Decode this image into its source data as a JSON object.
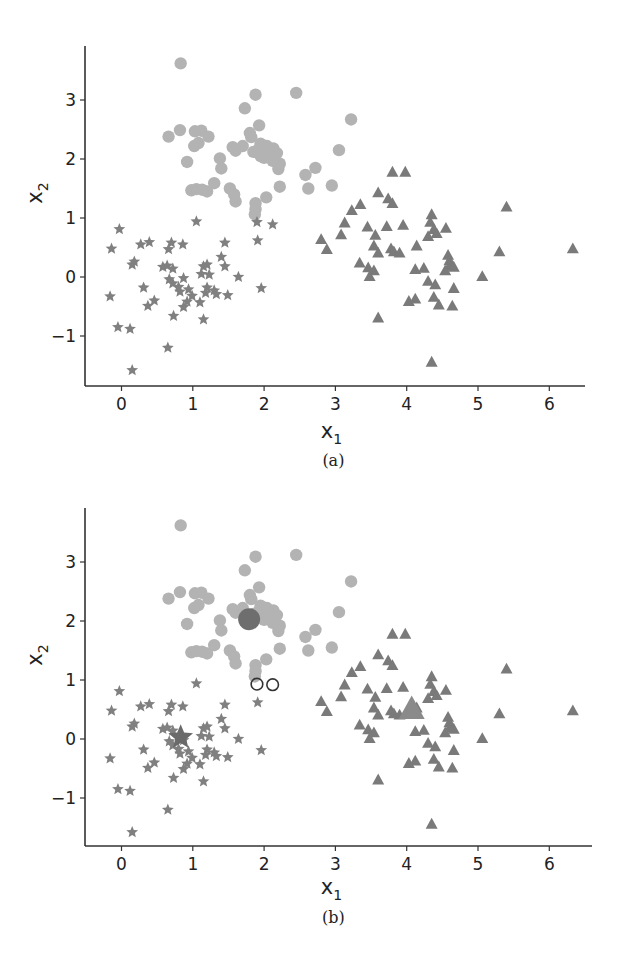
{
  "figure": {
    "panels": [
      {
        "id": "a",
        "caption": "(a)"
      },
      {
        "id": "b",
        "caption": "(b)"
      }
    ]
  },
  "chart_data": [
    {
      "type": "scatter",
      "title": "",
      "caption": "(a)",
      "xlabel": "x1",
      "ylabel": "x2",
      "xlim": [
        -0.5,
        6.6
      ],
      "ylim": [
        -1.85,
        3.9
      ],
      "xticks": [
        0,
        1,
        2,
        3,
        4,
        5,
        6
      ],
      "yticks": [
        -1,
        0,
        1,
        2,
        3
      ],
      "grid": false,
      "legend": null,
      "series": [
        {
          "name": "cluster-circles",
          "marker": "circle",
          "color": "#b3b3b3",
          "points": [
            [
              0.83,
              3.62
            ],
            [
              0.66,
              2.38
            ],
            [
              0.82,
              2.49
            ],
            [
              1.03,
              2.47
            ],
            [
              1.12,
              2.48
            ],
            [
              1.22,
              2.38
            ],
            [
              1.02,
              2.22
            ],
            [
              1.08,
              2.27
            ],
            [
              0.92,
              1.95
            ],
            [
              1.38,
              2.01
            ],
            [
              1.4,
              1.84
            ],
            [
              1.56,
              2.2
            ],
            [
              1.6,
              2.14
            ],
            [
              1.7,
              2.22
            ],
            [
              1.8,
              2.44
            ],
            [
              1.82,
              2.37
            ],
            [
              1.73,
              2.86
            ],
            [
              1.88,
              3.09
            ],
            [
              1.93,
              2.57
            ],
            [
              1.95,
              2.26
            ],
            [
              1.85,
              2.12
            ],
            [
              1.95,
              2.05
            ],
            [
              2.0,
              2.02
            ],
            [
              2.06,
              2.12
            ],
            [
              2.13,
              2.18
            ],
            [
              2.18,
              2.1
            ],
            [
              2.22,
              1.92
            ],
            [
              2.2,
              1.83
            ],
            [
              1.92,
              2.16
            ],
            [
              2.04,
              2.22
            ],
            [
              2.12,
              1.97
            ],
            [
              0.98,
              1.47
            ],
            [
              1.05,
              1.49
            ],
            [
              1.13,
              1.48
            ],
            [
              1.2,
              1.45
            ],
            [
              1.3,
              1.59
            ],
            [
              1.52,
              1.5
            ],
            [
              1.58,
              1.4
            ],
            [
              1.6,
              1.28
            ],
            [
              1.88,
              1.25
            ],
            [
              1.88,
              1.15
            ],
            [
              1.87,
              1.06
            ],
            [
              2.03,
              1.35
            ],
            [
              2.22,
              1.53
            ],
            [
              2.45,
              3.12
            ],
            [
              2.58,
              1.73
            ],
            [
              2.62,
              1.5
            ],
            [
              2.72,
              1.85
            ],
            [
              2.95,
              1.55
            ],
            [
              3.05,
              2.15
            ],
            [
              3.22,
              2.67
            ]
          ]
        },
        {
          "name": "cluster-stars",
          "marker": "star",
          "color": "#808080",
          "points": [
            [
              -0.03,
              0.81
            ],
            [
              -0.14,
              0.48
            ],
            [
              0.15,
              0.21
            ],
            [
              0.18,
              0.26
            ],
            [
              0.27,
              0.55
            ],
            [
              0.39,
              0.59
            ],
            [
              0.66,
              0.47
            ],
            [
              0.7,
              0.58
            ],
            [
              0.86,
              0.55
            ],
            [
              1.05,
              0.94
            ],
            [
              1.45,
              0.58
            ],
            [
              1.9,
              0.93
            ],
            [
              1.91,
              0.62
            ],
            [
              2.12,
              0.89
            ],
            [
              -0.16,
              -0.33
            ],
            [
              0.31,
              -0.18
            ],
            [
              0.37,
              -0.49
            ],
            [
              0.46,
              -0.4
            ],
            [
              0.58,
              0.17
            ],
            [
              0.64,
              0.19
            ],
            [
              0.72,
              0.14
            ],
            [
              0.67,
              -0.04
            ],
            [
              0.72,
              -0.11
            ],
            [
              0.8,
              -0.17
            ],
            [
              0.82,
              -0.25
            ],
            [
              0.87,
              -0.02
            ],
            [
              0.94,
              -0.21
            ],
            [
              0.99,
              -0.32
            ],
            [
              0.92,
              -0.42
            ],
            [
              0.87,
              -0.51
            ],
            [
              1.1,
              -0.43
            ],
            [
              1.12,
              0.05
            ],
            [
              1.15,
              0.18
            ],
            [
              1.2,
              0.21
            ],
            [
              1.23,
              0.04
            ],
            [
              1.2,
              -0.18
            ],
            [
              1.18,
              -0.27
            ],
            [
              1.3,
              -0.23
            ],
            [
              1.33,
              -0.29
            ],
            [
              1.4,
              0.34
            ],
            [
              1.45,
              0.18
            ],
            [
              1.49,
              -0.31
            ],
            [
              1.64,
              0.0
            ],
            [
              1.96,
              -0.19
            ],
            [
              0.73,
              -0.66
            ],
            [
              1.15,
              -0.72
            ],
            [
              -0.05,
              -0.85
            ],
            [
              0.12,
              -0.88
            ],
            [
              0.65,
              -1.2
            ],
            [
              0.15,
              -1.58
            ]
          ]
        },
        {
          "name": "cluster-triangles",
          "marker": "triangle",
          "color": "#7a7a7a",
          "points": [
            [
              3.35,
              1.22
            ],
            [
              3.8,
              1.77
            ],
            [
              3.98,
              1.77
            ],
            [
              3.6,
              1.42
            ],
            [
              3.74,
              1.32
            ],
            [
              3.8,
              1.24
            ],
            [
              3.23,
              1.12
            ],
            [
              3.13,
              0.91
            ],
            [
              3.08,
              0.71
            ],
            [
              2.8,
              0.63
            ],
            [
              2.88,
              0.46
            ],
            [
              3.45,
              0.84
            ],
            [
              3.56,
              0.7
            ],
            [
              3.72,
              0.85
            ],
            [
              3.95,
              0.87
            ],
            [
              4.35,
              1.05
            ],
            [
              4.33,
              0.92
            ],
            [
              4.38,
              0.8
            ],
            [
              4.42,
              0.73
            ],
            [
              4.55,
              0.82
            ],
            [
              4.3,
              0.68
            ],
            [
              3.54,
              0.52
            ],
            [
              3.6,
              0.4
            ],
            [
              3.78,
              0.47
            ],
            [
              3.82,
              0.42
            ],
            [
              3.9,
              0.4
            ],
            [
              4.14,
              0.52
            ],
            [
              3.34,
              0.23
            ],
            [
              3.46,
              0.15
            ],
            [
              3.54,
              0.1
            ],
            [
              3.48,
              0.0
            ],
            [
              4.58,
              0.36
            ],
            [
              4.6,
              0.27
            ],
            [
              4.6,
              0.18
            ],
            [
              4.54,
              0.1
            ],
            [
              4.66,
              0.16
            ],
            [
              4.12,
              0.12
            ],
            [
              4.24,
              0.14
            ],
            [
              4.3,
              -0.08
            ],
            [
              4.4,
              -0.14
            ],
            [
              4.66,
              -0.2
            ],
            [
              4.12,
              -0.38
            ],
            [
              4.03,
              -0.42
            ],
            [
              4.38,
              -0.35
            ],
            [
              4.45,
              -0.48
            ],
            [
              4.64,
              -0.5
            ],
            [
              5.06,
              0.0
            ],
            [
              5.3,
              0.42
            ],
            [
              5.4,
              1.18
            ],
            [
              6.33,
              0.47
            ],
            [
              3.6,
              -0.7
            ],
            [
              4.35,
              -1.45
            ]
          ]
        }
      ]
    },
    {
      "type": "scatter",
      "title": "",
      "caption": "(b)",
      "xlabel": "x1",
      "ylabel": "x2",
      "xlim": [
        -0.5,
        6.6
      ],
      "ylim": [
        -1.85,
        3.9
      ],
      "xticks": [
        0,
        1,
        2,
        3,
        4,
        5,
        6
      ],
      "yticks": [
        -1,
        0,
        1,
        2,
        3
      ],
      "grid": false,
      "legend": null,
      "series": [
        {
          "name": "cluster-circles",
          "marker": "circle",
          "color": "#b3b3b3",
          "same_points_as": "(a) cluster-circles (excluding two unassigned points)"
        },
        {
          "name": "cluster-stars",
          "marker": "star",
          "color": "#808080",
          "same_points_as": "(a) cluster-stars"
        },
        {
          "name": "cluster-triangles",
          "marker": "triangle",
          "color": "#7a7a7a",
          "same_points_as": "(a) cluster-triangles"
        },
        {
          "name": "centroids",
          "marker": "large-filled",
          "color": "#6e6e6e",
          "points": [
            {
              "cluster": "circles",
              "marker": "circle",
              "x": 1.79,
              "y": 2.03
            },
            {
              "cluster": "stars",
              "marker": "star",
              "x": 0.83,
              "y": 0.03
            },
            {
              "cluster": "triangles",
              "marker": "triangle",
              "x": 4.07,
              "y": 0.49
            }
          ]
        },
        {
          "name": "unassigned-open-circles",
          "marker": "open-circle",
          "color": "#333333",
          "points": [
            [
              1.9,
              0.93
            ],
            [
              2.12,
              0.92
            ]
          ]
        }
      ]
    }
  ]
}
